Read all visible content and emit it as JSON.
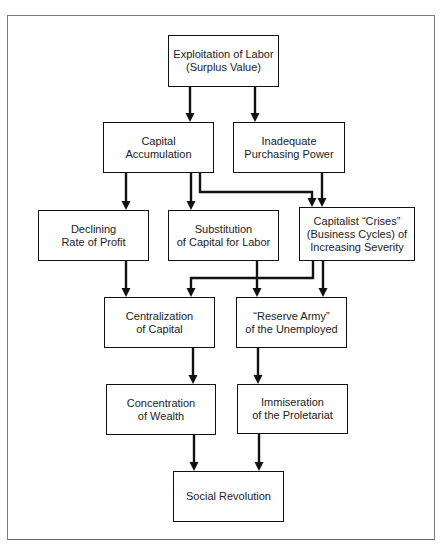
{
  "diagram": {
    "type": "flowchart",
    "nodes": [
      {
        "id": "exploitation",
        "lines": [
          "Exploitation of Labor",
          "(Surplus Value)"
        ]
      },
      {
        "id": "capital_accumulation",
        "lines": [
          "Capital",
          "Accumulation"
        ]
      },
      {
        "id": "inadequate_purchasing",
        "lines": [
          "Inadequate",
          "Purchasing Power"
        ]
      },
      {
        "id": "declining_profit",
        "lines": [
          "Declining",
          "Rate of Profit"
        ]
      },
      {
        "id": "substitution",
        "lines": [
          "Substitution",
          "of Capital for Labor"
        ]
      },
      {
        "id": "crises",
        "lines": [
          "Capitalist “Crises”",
          "(Business Cycles) of",
          "Increasing Severity"
        ]
      },
      {
        "id": "centralization",
        "lines": [
          "Centralization",
          "of Capital"
        ]
      },
      {
        "id": "reserve_army",
        "lines": [
          "“Reserve Army”",
          "of the Unemployed"
        ]
      },
      {
        "id": "concentration",
        "lines": [
          "Concentration",
          "of Wealth"
        ]
      },
      {
        "id": "immiseration",
        "lines": [
          "Immiseration",
          "of the Proletariat"
        ]
      },
      {
        "id": "social_revolution",
        "lines": [
          "Social Revolution"
        ]
      }
    ],
    "edges": [
      {
        "from": "exploitation",
        "to": "capital_accumulation"
      },
      {
        "from": "exploitation",
        "to": "inadequate_purchasing"
      },
      {
        "from": "capital_accumulation",
        "to": "declining_profit"
      },
      {
        "from": "capital_accumulation",
        "to": "substitution"
      },
      {
        "from": "capital_accumulation",
        "to": "crises"
      },
      {
        "from": "inadequate_purchasing",
        "to": "crises"
      },
      {
        "from": "declining_profit",
        "to": "centralization"
      },
      {
        "from": "substitution",
        "to": "reserve_army"
      },
      {
        "from": "crises",
        "to": "centralization"
      },
      {
        "from": "crises",
        "to": "reserve_army"
      },
      {
        "from": "centralization",
        "to": "concentration"
      },
      {
        "from": "reserve_army",
        "to": "immiseration"
      },
      {
        "from": "concentration",
        "to": "social_revolution"
      },
      {
        "from": "immiseration",
        "to": "social_revolution"
      }
    ],
    "style": {
      "line_color": "#111111",
      "box_border_color": "#111111",
      "frame_color": "#7a7a7a",
      "background": "#ffffff"
    }
  }
}
